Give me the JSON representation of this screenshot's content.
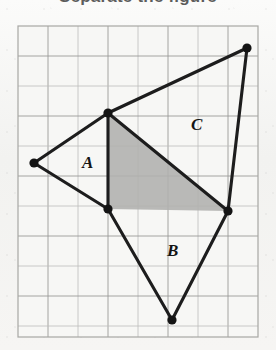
{
  "heading": {
    "text": "Separate the figure",
    "note": "clipped at top edge of scan"
  },
  "figure": {
    "name": "composite-polygon-on-grid",
    "grid": {
      "x": 18,
      "y": 26,
      "width": 240,
      "height": 311,
      "cell": 30,
      "cols": 8,
      "rows": 10,
      "line_color": "#9a9a98",
      "border_color": "#a7a7a4",
      "background": "#f7f7f5"
    },
    "style": {
      "edge_color": "#1d1d1d",
      "edge_width": 3.1,
      "shade_color": "#b0b0ae",
      "vertex_color": "#141414",
      "vertex_radius": 4.6
    },
    "vertices": [
      {
        "id": "P1",
        "name": "top-right-vertex",
        "x": 247,
        "y": 48
      },
      {
        "id": "P2",
        "name": "top-middle-vertex",
        "x": 108,
        "y": 113
      },
      {
        "id": "P3",
        "name": "left-vertex",
        "x": 34,
        "y": 163
      },
      {
        "id": "P4",
        "name": "inner-left-vertex",
        "x": 108,
        "y": 209
      },
      {
        "id": "P5",
        "name": "bottom-vertex",
        "x": 172,
        "y": 320
      },
      {
        "id": "P6",
        "name": "right-vertex",
        "x": 228,
        "y": 211
      }
    ],
    "outline_path": "247,48 108,113 34,163 108,209 172,320 228,211 247,48",
    "shaded_triangle": {
      "name": "shaded-region",
      "points": "108,113 228,211 108,209",
      "fill": "#b0b0ae"
    },
    "internal_edges": [
      {
        "name": "edge-P2-P4",
        "from": "P2",
        "to": "P4"
      },
      {
        "name": "edge-P2-P6",
        "from": "P2",
        "to": "P6"
      }
    ],
    "labels": [
      {
        "id": "A",
        "name": "region-label-a",
        "text": "A",
        "x": 82,
        "y": 168
      },
      {
        "id": "B",
        "name": "region-label-b",
        "text": "B",
        "x": 167,
        "y": 256
      },
      {
        "id": "C",
        "name": "region-label-c",
        "text": "C",
        "x": 191,
        "y": 130
      }
    ]
  }
}
